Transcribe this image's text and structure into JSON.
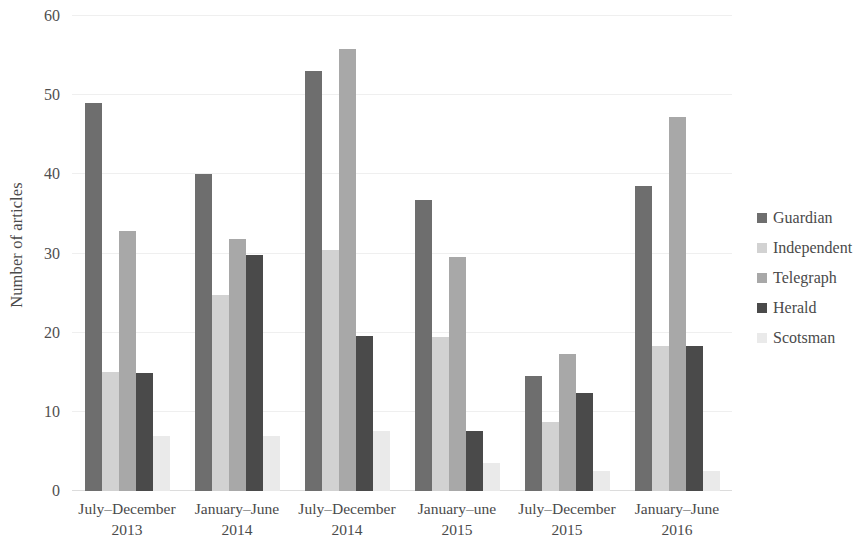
{
  "chart_data": {
    "type": "bar",
    "title": "",
    "xlabel": "",
    "ylabel": "Number of articles",
    "ylim": [
      0,
      60
    ],
    "yticks": [
      0,
      10,
      20,
      30,
      40,
      50,
      60
    ],
    "grid": true,
    "legend_position": "right",
    "categories": [
      "July–December 2013",
      "January–June 2014",
      "July–December 2014",
      "January–une 2015",
      "July–December 2015",
      "January–June 2016"
    ],
    "series": [
      {
        "name": "Guardian",
        "color": "#6e6e6e",
        "values": [
          49.0,
          40.0,
          53.0,
          36.7,
          14.5,
          38.5
        ]
      },
      {
        "name": "Independent",
        "color": "#d2d2d2",
        "values": [
          15.0,
          24.8,
          30.5,
          19.5,
          8.7,
          18.3
        ]
      },
      {
        "name": "Telegraph",
        "color": "#a8a8a8",
        "values": [
          32.9,
          31.8,
          55.8,
          29.6,
          17.3,
          47.2
        ]
      },
      {
        "name": "Herald",
        "color": "#4a4a4a",
        "values": [
          14.9,
          29.8,
          19.6,
          7.6,
          12.4,
          18.3
        ]
      },
      {
        "name": "Scotsman",
        "color": "#eaeaea",
        "values": [
          7.0,
          7.0,
          7.6,
          3.5,
          2.5,
          2.5
        ]
      }
    ]
  },
  "axis": {
    "y_title": "Number of articles"
  },
  "legend": {
    "entries": [
      {
        "label": "Guardian",
        "swatch_color": "#6e6e6e"
      },
      {
        "label": "Independent",
        "swatch_color": "#d2d2d2"
      },
      {
        "label": "Telegraph",
        "swatch_color": "#a8a8a8"
      },
      {
        "label": "Herald",
        "swatch_color": "#4a4a4a"
      },
      {
        "label": "Scotsman",
        "swatch_color": "#eaeaea"
      }
    ]
  }
}
